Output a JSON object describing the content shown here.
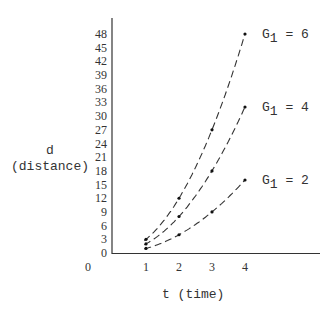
{
  "chart_data": {
    "type": "line",
    "title": "",
    "xlabel": "t (time)",
    "ylabel_line1": "d",
    "ylabel_line2": "(distance)",
    "x_ticks": [
      0,
      1,
      2,
      3,
      4
    ],
    "y_ticks": [
      0,
      3,
      6,
      9,
      12,
      15,
      18,
      21,
      24,
      27,
      30,
      33,
      36,
      39,
      42,
      45,
      48
    ],
    "xlim": [
      0,
      6.3
    ],
    "ylim": [
      0,
      51
    ],
    "grid": false,
    "line_style": "dashed",
    "x": [
      1,
      2,
      3,
      4
    ],
    "series": [
      {
        "name": "G1 = 6",
        "label_base": "G",
        "label_sub": "1",
        "label_value": "= 6",
        "values": [
          3,
          12,
          27,
          48
        ]
      },
      {
        "name": "G1 = 4",
        "label_base": "G",
        "label_sub": "1",
        "label_value": "= 4",
        "values": [
          2,
          8,
          18,
          32
        ]
      },
      {
        "name": "G1 = 2",
        "label_base": "G",
        "label_sub": "1",
        "label_value": "= 2",
        "values": [
          1,
          4,
          9,
          16
        ]
      }
    ],
    "legend_position": "inline-right-of-curves"
  }
}
